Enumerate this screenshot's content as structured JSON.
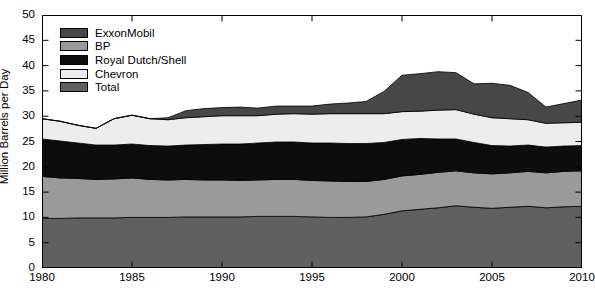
{
  "chart_data": {
    "type": "area",
    "stacked": true,
    "title": "",
    "xlabel": "",
    "ylabel": "Million Barrels per Day",
    "xlim": [
      1980,
      2010
    ],
    "ylim": [
      0,
      50
    ],
    "yticks": [
      0,
      5,
      10,
      15,
      20,
      25,
      30,
      35,
      40,
      45,
      50
    ],
    "xticks": [
      1980,
      1985,
      1990,
      1995,
      2000,
      2005,
      2010
    ],
    "grid": false,
    "legend_position": "top-left",
    "x": [
      1980,
      1981,
      1982,
      1983,
      1984,
      1985,
      1986,
      1987,
      1988,
      1989,
      1990,
      1991,
      1992,
      1993,
      1994,
      1995,
      1996,
      1997,
      1998,
      1999,
      2000,
      2001,
      2002,
      2003,
      2004,
      2005,
      2006,
      2007,
      2008,
      2009,
      2010
    ],
    "stack_order_bottom_to_top": [
      "Total",
      "BP",
      "Royal Dutch/Shell",
      "Chevron",
      "ExxonMobil"
    ],
    "series": [
      {
        "name": "ExxonMobil",
        "color": "#474747",
        "values": [
          0,
          0,
          0,
          0,
          0,
          0,
          0,
          0.4,
          1.4,
          1.6,
          1.6,
          1.7,
          1.5,
          1.6,
          1.5,
          1.6,
          1.9,
          2.1,
          2.4,
          4.4,
          7.2,
          7.4,
          7.6,
          7.3,
          6.0,
          6.8,
          6.6,
          5.4,
          3.2,
          3.8,
          4.4
        ]
      },
      {
        "name": "BP",
        "color": "#9a9a9a",
        "values": [
          8.3,
          8.0,
          7.8,
          7.6,
          7.7,
          7.8,
          7.5,
          7.4,
          7.4,
          7.3,
          7.3,
          7.2,
          7.2,
          7.3,
          7.3,
          7.2,
          7.2,
          7.1,
          7.0,
          6.9,
          6.9,
          6.9,
          7.0,
          6.9,
          6.8,
          6.8,
          6.8,
          6.9,
          6.9,
          7.0,
          7.0
        ]
      },
      {
        "name": "Royal Dutch/Shell",
        "color": "#0d0d0d",
        "values": [
          7.4,
          7.3,
          7.0,
          6.8,
          6.7,
          6.7,
          6.7,
          6.7,
          6.8,
          7.0,
          7.1,
          7.2,
          7.3,
          7.4,
          7.4,
          7.4,
          7.5,
          7.5,
          7.5,
          7.3,
          7.2,
          7.1,
          6.6,
          6.3,
          6.0,
          5.6,
          5.3,
          5.2,
          5.1,
          5.0,
          5.0
        ]
      },
      {
        "name": "Chevron",
        "color": "#ededed",
        "values": [
          4.0,
          3.9,
          3.5,
          3.3,
          5.2,
          5.7,
          5.3,
          5.2,
          5.4,
          5.5,
          5.6,
          5.6,
          5.4,
          5.5,
          5.6,
          5.7,
          5.8,
          5.9,
          5.9,
          5.7,
          5.5,
          5.4,
          5.7,
          5.8,
          5.6,
          5.5,
          5.4,
          5.0,
          4.7,
          4.6,
          4.6
        ]
      },
      {
        "name": "Total",
        "color": "#606060",
        "values": [
          9.8,
          9.8,
          9.9,
          9.9,
          9.9,
          10.0,
          10.0,
          10.0,
          10.1,
          10.1,
          10.1,
          10.1,
          10.2,
          10.2,
          10.2,
          10.1,
          10.0,
          10.0,
          10.1,
          10.6,
          11.3,
          11.6,
          11.9,
          12.3,
          12.0,
          11.8,
          12.0,
          12.2,
          11.9,
          12.1,
          12.2
        ]
      }
    ],
    "stacked_totals": [
      29.5,
      29.0,
      28.2,
      27.6,
      29.5,
      30.2,
      29.5,
      29.7,
      31.1,
      31.5,
      31.7,
      31.8,
      31.6,
      32.0,
      32.0,
      32.0,
      32.4,
      32.6,
      32.9,
      34.9,
      38.1,
      38.4,
      38.8,
      38.6,
      36.4,
      36.5,
      36.1,
      34.7,
      31.8,
      32.5,
      33.2
    ]
  },
  "axes": {
    "ylabel": "Million Barrels per Day",
    "yticks": [
      "0",
      "5",
      "10",
      "15",
      "20",
      "25",
      "30",
      "35",
      "40",
      "45",
      "50"
    ],
    "xticks": [
      "1980",
      "1985",
      "1990",
      "1995",
      "2000",
      "2005",
      "2010"
    ]
  },
  "legend": {
    "items": [
      {
        "label": "ExxonMobil",
        "color": "#474747"
      },
      {
        "label": "BP",
        "color": "#9a9a9a"
      },
      {
        "label": "Royal Dutch/Shell",
        "color": "#0d0d0d"
      },
      {
        "label": "Chevron",
        "color": "#ededed"
      },
      {
        "label": "Total",
        "color": "#606060"
      }
    ]
  }
}
